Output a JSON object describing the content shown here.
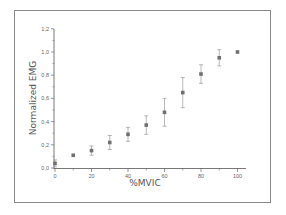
{
  "chart_data": {
    "type": "scatter",
    "title": "",
    "xlabel": "%MVIC",
    "ylabel": "Normalized EMG",
    "xlim": [
      0,
      105
    ],
    "ylim": [
      0,
      1.2
    ],
    "x_ticks": [
      "0",
      "20",
      "40",
      "60",
      "80",
      "100"
    ],
    "y_ticks": [
      "0,0",
      "0,2",
      "0,4",
      "0,6",
      "0,8",
      "1,0",
      "1,2"
    ],
    "grid": false,
    "legend": null,
    "series": [
      {
        "name": "Normalized EMG",
        "x": [
          0,
          10,
          20,
          30,
          40,
          50,
          60,
          70,
          80,
          90,
          100
        ],
        "y": [
          0.04,
          0.11,
          0.15,
          0.22,
          0.29,
          0.37,
          0.48,
          0.65,
          0.81,
          0.95,
          1.0
        ],
        "error": [
          0.03,
          0.0,
          0.04,
          0.06,
          0.06,
          0.08,
          0.12,
          0.13,
          0.08,
          0.07,
          0.0
        ]
      }
    ]
  },
  "colors": {
    "marker": "#707070",
    "errorbar": "#9a9a9a",
    "axis": "#555555",
    "frame": "#8a8a8a"
  }
}
